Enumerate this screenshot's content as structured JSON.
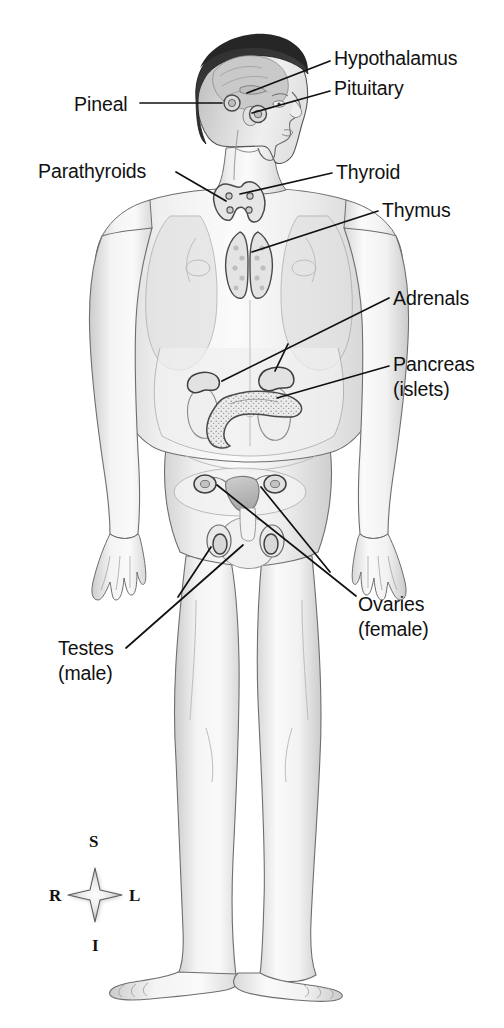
{
  "figure": {
    "background_color": "#ffffff",
    "line_color": "#111111",
    "text_color": "#111111"
  },
  "labels": [
    {
      "key": "hypothalamus",
      "text": "Hypothalamus",
      "x": 334,
      "y": 46,
      "align": "left",
      "leader": {
        "x1": 330,
        "y1": 61,
        "x2": 247,
        "y2": 93
      }
    },
    {
      "key": "pituitary",
      "text": "Pituitary",
      "x": 334,
      "y": 76,
      "align": "left",
      "leader": {
        "x1": 330,
        "y1": 91,
        "x2": 252,
        "y2": 113
      }
    },
    {
      "key": "pineal",
      "text": "Pineal",
      "x": 74,
      "y": 92,
      "align": "left",
      "leader": {
        "x1": 140,
        "y1": 103,
        "x2": 222,
        "y2": 103
      }
    },
    {
      "key": "parathyroids",
      "text": "Parathyroids",
      "x": 38,
      "y": 159,
      "align": "left",
      "leader": {
        "x1": 176,
        "y1": 172,
        "x2": 226,
        "y2": 201
      }
    },
    {
      "key": "thyroid",
      "text": "Thyroid",
      "x": 336,
      "y": 160,
      "align": "left",
      "leader": {
        "x1": 332,
        "y1": 173,
        "x2": 240,
        "y2": 194
      }
    },
    {
      "key": "thymus",
      "text": "Thymus",
      "x": 382,
      "y": 198,
      "align": "left",
      "leader": {
        "x1": 378,
        "y1": 211,
        "x2": 252,
        "y2": 252
      }
    },
    {
      "key": "adrenals",
      "text": "Adrenals",
      "x": 393,
      "y": 286,
      "align": "left",
      "leader": {
        "x1": 389,
        "y1": 298,
        "x2": 222,
        "y2": 381
      },
      "branch": {
        "x1": 288,
        "y1": 344,
        "x2": 275,
        "y2": 371
      }
    },
    {
      "key": "pancreas",
      "text": "Pancreas",
      "text2": "(islets)",
      "x": 393,
      "y": 352,
      "align": "left",
      "leader": {
        "x1": 389,
        "y1": 366,
        "x2": 277,
        "y2": 398
      }
    },
    {
      "key": "ovaries",
      "text": "Ovaries",
      "text2": "(female)",
      "x": 358,
      "y": 592,
      "align": "left",
      "leader": {
        "x1": 356,
        "y1": 596,
        "x2": 217,
        "y2": 485
      },
      "branch": {
        "x1": 330,
        "y1": 572,
        "x2": 261,
        "y2": 487
      }
    },
    {
      "key": "testes",
      "text": "Testes",
      "text2": "(male)",
      "x": 58,
      "y": 636,
      "align": "left",
      "leader": {
        "x1": 126,
        "y1": 648,
        "x2": 243,
        "y2": 545
      },
      "branch": {
        "x1": 178,
        "y1": 597,
        "x2": 211,
        "y2": 547
      }
    }
  ],
  "compass": {
    "center_x": 95,
    "center_y": 895,
    "superior": "S",
    "inferior": "I",
    "right": "R",
    "left": "L"
  },
  "anatomy": {
    "view": "anterior full-body male figure, grayscale line art",
    "glands": [
      "pineal",
      "hypothalamus",
      "pituitary",
      "thyroid",
      "parathyroids",
      "thymus",
      "adrenals",
      "pancreas (islets)",
      "ovaries (female)",
      "testes (male)"
    ]
  }
}
